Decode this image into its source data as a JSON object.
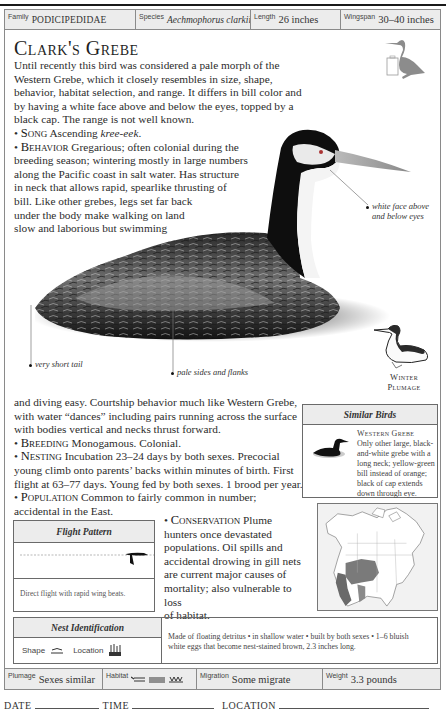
{
  "header": {
    "family_label": "Family",
    "family_value": "PODICIPEDIDAE",
    "species_label": "Species",
    "species_value": "Aechmophorus clarkii",
    "length_label": "Length",
    "length_value": "26 inches",
    "wingspan_label": "Wingspan",
    "wingspan_value": "30–40 inches"
  },
  "title": "Clark's Grebe",
  "intro": "Until recently this bird was considered a pale morph of the Western Grebe, which it closely resembles in size, shape, behavior, habitat selection, and range. It differs in bill color and by having a white face above and below the eyes, topped by a black cap. The range is not well known.",
  "song": {
    "head": "Song",
    "text": "Ascending ",
    "call": "kree-eek",
    "end": "."
  },
  "behavior": {
    "head": "Behavior",
    "lines": [
      "Gregarious; often colonial during the",
      "breeding season; wintering mostly in large numbers",
      "along the Pacific coast in salt water. Has structure",
      "in neck that allows rapid, spearlike thrusting of",
      "bill. Like other grebes, legs set far back",
      "under the body make walking on land",
      "slow and laborious but swimming"
    ],
    "continued": [
      "and diving easy. Courtship behavior much like Western Grebe,",
      "with water “dances” including pairs running across the surface",
      "with bodies vertical and necks thrust forward."
    ]
  },
  "breeding": {
    "head": "Breeding",
    "text": "Monogamous. Colonial."
  },
  "nesting": {
    "head": "Nesting",
    "lines": [
      "Incubation 23–24 days by both sexes. Precocial",
      "young climb onto parents’ backs within minutes of birth. First",
      "flight at 63–77 days. Young fed by both sexes. 1 brood per year."
    ]
  },
  "population": {
    "head": "Population",
    "lines": [
      "Common to fairly common in number;",
      "accidental in the East."
    ]
  },
  "conservation": {
    "head": "Conservation",
    "lines": [
      "Plume",
      "hunters once devastated",
      "populations. Oil spills and",
      "accidental drowing in gill nets",
      "are current major causes of",
      "mortality; also vulnerable to loss",
      "of habitat."
    ]
  },
  "callouts": {
    "face": [
      "white face above",
      "and below eyes"
    ],
    "tail": "very short tail",
    "sides": "pale sides and flanks"
  },
  "winter_plumage": [
    "Winter",
    "Plumage"
  ],
  "similar_birds": {
    "title": "Similar Birds",
    "name": "Western Grebe",
    "lines": [
      "Only other large, black-",
      "and-white grebe with a",
      "long neck; yellow-green",
      "bill instead of orange;",
      "black of cap extends",
      "down through eye."
    ]
  },
  "flight_pattern": {
    "title": "Flight Pattern",
    "caption": "Direct flight with rapid wing beats."
  },
  "nest_identification": {
    "title": "Nest Identification",
    "shape_label": "Shape",
    "location_label": "Location",
    "description": [
      "Made of floating detritus • in shallow water • built by both sexes • 1–6 bluish",
      "white eggs that become nest-stained brown, 2.3 inches long."
    ]
  },
  "footer": {
    "plumage_label": "Plumage",
    "plumage_value": "Sexes similar",
    "habitat_label": "Habitat",
    "migration_label": "Migration",
    "migration_value": "Some migrate",
    "weight_label": "Weight",
    "weight_value": "3.3 pounds"
  },
  "log": {
    "date": "DATE",
    "time": "TIME",
    "location": "LOCATION"
  },
  "colors": {
    "panel_bg": "#ececec",
    "rule": "#1a1a1a",
    "border": "#8a8a8a",
    "range_fill": "#7a7a7a"
  }
}
